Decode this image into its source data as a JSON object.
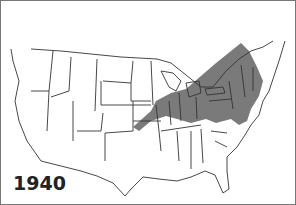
{
  "map": {
    "year_label": "1940",
    "region": "United States (contiguous) and southern Canada",
    "shaded_area_color": "#7a7a7a",
    "outline_color": "#333333",
    "shaded_description": "Northeastern US: New England, New York, Pennsylvania, New Jersey, Ohio, Michigan, Indiana, parts of Illinois, Maryland, Virginia; extending into southern Quebec/Ontario"
  }
}
